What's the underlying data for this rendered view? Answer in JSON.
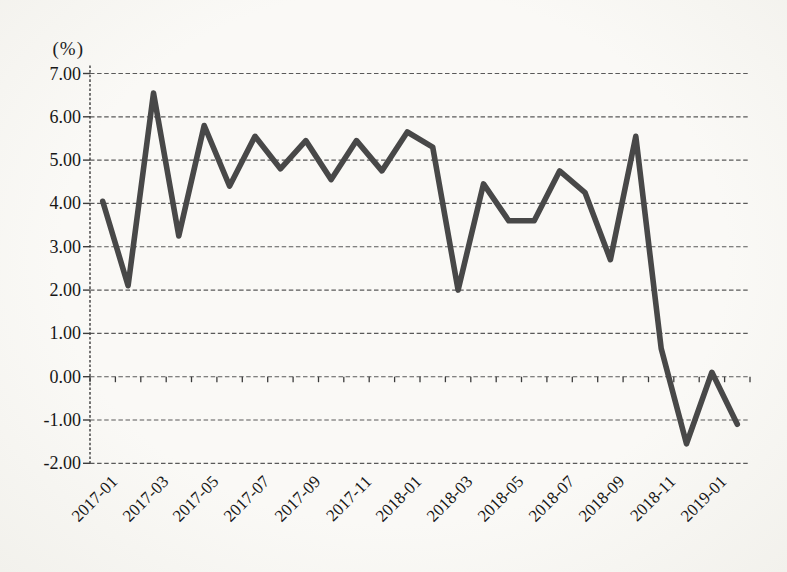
{
  "page": {
    "background": "#f6f5f2",
    "text_color": "#171717"
  },
  "chart_data": {
    "type": "line",
    "title": "",
    "unit_label": "(%)",
    "xlabel": "",
    "ylabel": "(%)",
    "legend": "none",
    "grid": "horizontal-dashed",
    "line_color": "#484848",
    "axis_color": "#3c3c3c",
    "x": [
      "2017-01",
      "2017-02",
      "2017-03",
      "2017-04",
      "2017-05",
      "2017-06",
      "2017-07",
      "2017-08",
      "2017-09",
      "2017-10",
      "2017-11",
      "2017-12",
      "2018-01",
      "2018-02",
      "2018-03",
      "2018-04",
      "2018-05",
      "2018-06",
      "2018-07",
      "2018-08",
      "2018-09",
      "2018-10",
      "2018-11",
      "2018-12",
      "2019-01",
      "2019-02"
    ],
    "values": [
      4.05,
      2.1,
      6.55,
      3.25,
      5.8,
      4.4,
      5.55,
      4.8,
      5.45,
      4.55,
      5.45,
      4.75,
      5.65,
      5.3,
      2.0,
      4.45,
      3.6,
      3.6,
      4.75,
      4.25,
      2.7,
      5.55,
      0.65,
      -1.55,
      0.1,
      -1.1
    ],
    "x_ticks_shown": [
      "2017-01",
      "2017-03",
      "2017-05",
      "2017-07",
      "2017-09",
      "2017-11",
      "2018-01",
      "2018-03",
      "2018-05",
      "2018-07",
      "2018-09",
      "2018-11",
      "2019-01"
    ],
    "y_ticks": [
      7,
      6,
      5,
      4,
      3,
      2,
      1,
      0,
      -1,
      -2
    ],
    "y_tick_labels": [
      "7.00",
      "6.00",
      "5.00",
      "4.00",
      "3.00",
      "2.00",
      "1.00",
      "0.00",
      "-1.00",
      "-2.00"
    ],
    "ylim": [
      -2,
      7
    ]
  }
}
